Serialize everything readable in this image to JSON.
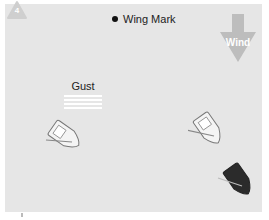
{
  "diagram": {
    "badge": {
      "number": "4",
      "color": "#cfcfcf"
    },
    "mark": {
      "label": "Wing Mark",
      "color": "#111111"
    },
    "wind": {
      "label": "Wind",
      "color": "#bdbdbd",
      "direction": "down"
    },
    "gust": {
      "label": "Gust",
      "line_count": 4
    },
    "boats": [
      {
        "id": "boat-left",
        "hull": "white",
        "heading": "southeast",
        "position": "left, below gust"
      },
      {
        "id": "boat-right-upper",
        "hull": "white",
        "heading": "southeast",
        "position": "right, middle"
      },
      {
        "id": "boat-right-lower",
        "hull": "dark",
        "heading": "southeast",
        "position": "right, bottom"
      }
    ],
    "colors": {
      "background": "#e6e6e6",
      "page": "#ffffff",
      "dark_boat": "#2b2b2b",
      "light_boat": "#f4f4f4"
    }
  }
}
